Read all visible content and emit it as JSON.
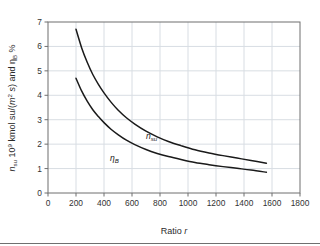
{
  "chart_data": {
    "type": "line",
    "title": "",
    "xlabel": "Ratio r",
    "ylabel": "n_su 10^9 kmol su/(m^2 s) and η_B %",
    "xlim": [
      0,
      1800
    ],
    "ylim": [
      0,
      7
    ],
    "xticks": [
      0,
      200,
      400,
      600,
      800,
      1000,
      1200,
      1400,
      1600,
      1800
    ],
    "yticks": [
      0,
      1,
      2,
      3,
      4,
      5,
      6,
      7
    ],
    "grid": true,
    "legend_position": "inline-labels",
    "series": [
      {
        "name": "n_su",
        "label": "n",
        "label_sub": "su",
        "color": "#1a1a1a",
        "x": [
          200,
          240,
          280,
          320,
          360,
          400,
          450,
          500,
          560,
          620,
          700,
          780,
          860,
          950,
          1050,
          1150,
          1250,
          1350,
          1450,
          1560
        ],
        "y": [
          6.7,
          5.95,
          5.35,
          4.85,
          4.45,
          4.1,
          3.72,
          3.4,
          3.08,
          2.82,
          2.53,
          2.3,
          2.11,
          1.94,
          1.77,
          1.64,
          1.53,
          1.43,
          1.33,
          1.22
        ]
      },
      {
        "name": "eta_B",
        "label": "η",
        "label_sub": "B",
        "color": "#1a1a1a",
        "x": [
          200,
          240,
          280,
          320,
          360,
          400,
          450,
          500,
          560,
          620,
          700,
          780,
          860,
          950,
          1050,
          1150,
          1250,
          1350,
          1450,
          1560
        ],
        "y": [
          4.7,
          4.18,
          3.76,
          3.41,
          3.13,
          2.88,
          2.61,
          2.39,
          2.16,
          1.98,
          1.78,
          1.62,
          1.49,
          1.37,
          1.25,
          1.16,
          1.08,
          1.01,
          0.94,
          0.85
        ]
      }
    ],
    "annotations": [
      {
        "name": "n_su-curve-label",
        "text": "n",
        "sub": "su",
        "x": 740,
        "y": 2.22
      },
      {
        "name": "eta_B-curve-label",
        "text": "η",
        "sub": "B",
        "x": 475,
        "y": 1.33
      }
    ]
  },
  "axis": {
    "y_label_parts": {
      "p1": "n",
      "p1_sub": "su",
      "p2": " 10",
      "p2_sup": "9",
      "p3": " kmol su/(",
      "p3_it": "m",
      "p3_sup": "2",
      "p4": " s",
      "p5": ") and ",
      "p6": "η",
      "p6_sub": "B",
      "p7": " %"
    },
    "x_label_static": "Ratio ",
    "x_label_italic": "r"
  },
  "colors": {
    "curve": "#1a1a1a",
    "grid": "#d8dde3",
    "frame": "#6f6f6f",
    "text": "#2b2b2b",
    "background": "#ffffff"
  }
}
